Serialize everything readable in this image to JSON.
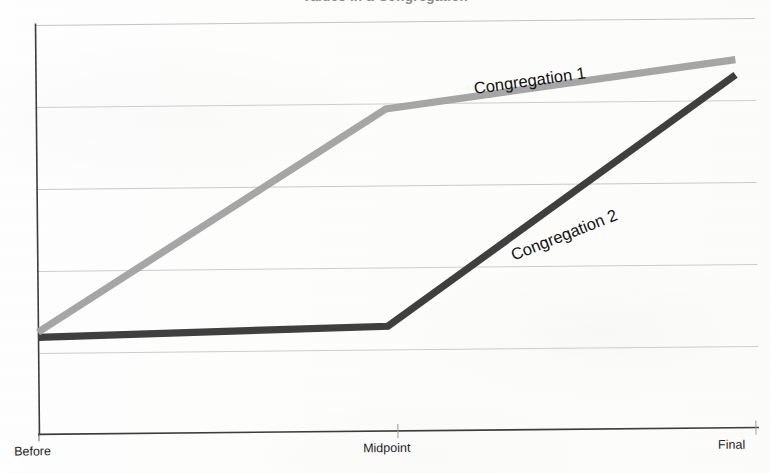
{
  "chart_data": {
    "type": "line",
    "title": "Values in a Congregation",
    "title_clipped": true,
    "categories": [
      "Before",
      "Midpoint",
      "Final"
    ],
    "series": [
      {
        "name": "Congregation 1",
        "label": "Congregation 1",
        "color": "#a6a6a6",
        "values": [
          2.0,
          6.3,
          7.2
        ]
      },
      {
        "name": "Congregation 2",
        "label": "Congregation 2",
        "color": "#3f3f3f",
        "values": [
          1.9,
          2.05,
          6.9
        ]
      }
    ],
    "xlabel": "",
    "ylabel": "",
    "ylim": [
      0,
      8
    ],
    "yticks": [
      0,
      2,
      4,
      6,
      8
    ],
    "ytick_labels": [],
    "grid": true,
    "grid_axis": "y",
    "legend": "none",
    "series_labels_inline": true,
    "annotations": [
      {
        "text": "Congregation 1",
        "near_series": "Congregation 1",
        "rotation_deg": -7.5
      },
      {
        "text": "Congregation 2",
        "near_series": "Congregation 2",
        "rotation_deg": -21
      }
    ]
  },
  "axes": {
    "x_tick_labels": [
      "Before",
      "Midpoint",
      "Final"
    ],
    "axis_color": "#444444",
    "grid_color": "#c9c9c9"
  },
  "style": {
    "background": "#fdfdfc",
    "line_width_px": 7,
    "series_1_color": "#a6a6a6",
    "series_2_color": "#3f3f3f"
  }
}
